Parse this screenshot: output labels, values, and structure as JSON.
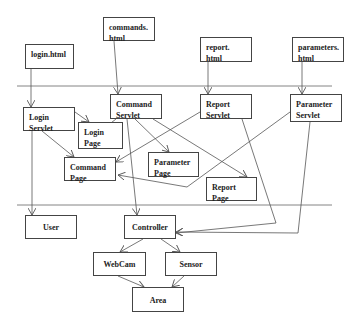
{
  "diagram": {
    "layers": [
      {
        "name": "client-layer-divider",
        "y": 86
      },
      {
        "name": "model-layer-divider",
        "y": 205
      }
    ],
    "nodes": [
      {
        "id": "login_html",
        "label": "login.html",
        "x": 25,
        "y": 44,
        "w": 49,
        "h": 25
      },
      {
        "id": "commands_html",
        "label": "commands.\nhtml",
        "x": 103,
        "y": 17,
        "w": 52,
        "h": 24
      },
      {
        "id": "report_html",
        "label": "report.\nhtml",
        "x": 200,
        "y": 37,
        "w": 52,
        "h": 25
      },
      {
        "id": "parameters_html",
        "label": "parameters.\nhtml",
        "x": 292,
        "y": 37,
        "w": 52,
        "h": 25
      },
      {
        "id": "login_servlet",
        "label": "Login\nServlet",
        "x": 23,
        "y": 107,
        "w": 52,
        "h": 24
      },
      {
        "id": "command_servlet",
        "label": "Command\nServlet",
        "x": 110,
        "y": 94,
        "w": 52,
        "h": 25
      },
      {
        "id": "login_page",
        "label": "Login\nPage",
        "x": 78,
        "y": 122,
        "w": 45,
        "h": 27
      },
      {
        "id": "report_servlet",
        "label": "Report\nServlet",
        "x": 200,
        "y": 94,
        "w": 52,
        "h": 25
      },
      {
        "id": "parameter_servlet",
        "label": "Parameter\nServlet",
        "x": 290,
        "y": 94,
        "w": 52,
        "h": 28
      },
      {
        "id": "command_page",
        "label": "Command\nPage",
        "x": 64,
        "y": 157,
        "w": 52,
        "h": 24
      },
      {
        "id": "parameter_page",
        "label": "Parameter\nPage",
        "x": 148,
        "y": 152,
        "w": 51,
        "h": 25
      },
      {
        "id": "report_page",
        "label": "Report\nPage",
        "x": 206,
        "y": 177,
        "w": 51,
        "h": 24
      },
      {
        "id": "user",
        "label": "User",
        "x": 25,
        "y": 215,
        "w": 52,
        "h": 24
      },
      {
        "id": "controller",
        "label": "Controller",
        "x": 124,
        "y": 215,
        "w": 52,
        "h": 24
      },
      {
        "id": "webcam",
        "label": "WebCam",
        "x": 93,
        "y": 252,
        "w": 53,
        "h": 24
      },
      {
        "id": "sensor",
        "label": "Sensor",
        "x": 165,
        "y": 252,
        "w": 52,
        "h": 24
      },
      {
        "id": "area",
        "label": "Area",
        "x": 132,
        "y": 287,
        "w": 52,
        "h": 25
      }
    ],
    "edges": [
      {
        "from": "login_html",
        "to": "login_servlet",
        "points": [
          [
            31,
            69
          ],
          [
            31,
            107
          ]
        ]
      },
      {
        "from": "commands_html",
        "to": "command_servlet",
        "points": [
          [
            114,
            41
          ],
          [
            118,
            94
          ]
        ]
      },
      {
        "from": "report_html",
        "to": "report_servlet",
        "points": [
          [
            208,
            62
          ],
          [
            208,
            94
          ]
        ]
      },
      {
        "from": "parameters_html",
        "to": "parameter_servlet",
        "points": [
          [
            302,
            62
          ],
          [
            302,
            94
          ]
        ]
      },
      {
        "from": "login_servlet",
        "to": "login_page",
        "points": [
          [
            75,
            112
          ],
          [
            89,
            122
          ]
        ]
      },
      {
        "from": "command_servlet",
        "to": "login_page",
        "points": [
          [
            116,
            119
          ],
          [
            102,
            130
          ]
        ]
      },
      {
        "from": "login_servlet",
        "to": "command_page",
        "points": [
          [
            42,
            131
          ],
          [
            74,
            157
          ]
        ]
      },
      {
        "from": "login_servlet",
        "to": "user",
        "points": [
          [
            32,
            131
          ],
          [
            32,
            215
          ]
        ]
      },
      {
        "from": "command_servlet",
        "to": "parameter_page",
        "points": [
          [
            135,
            119
          ],
          [
            169,
            152
          ]
        ]
      },
      {
        "from": "command_servlet",
        "to": "report_page",
        "points": [
          [
            153,
            119
          ],
          [
            247,
            177
          ]
        ]
      },
      {
        "from": "command_servlet",
        "to": "controller",
        "points": [
          [
            127,
            119
          ],
          [
            137,
            215
          ]
        ]
      },
      {
        "from": "report_servlet",
        "to": "command_page",
        "points": [
          [
            200,
            112
          ],
          [
            116,
            162
          ]
        ]
      },
      {
        "from": "parameter_servlet",
        "to": "command_page",
        "points": [
          [
            290,
            112
          ],
          [
            187,
            187
          ],
          [
            118,
            175
          ]
        ]
      },
      {
        "from": "report_servlet",
        "to": "controller",
        "points": [
          [
            242,
            119
          ],
          [
            276,
            223
          ],
          [
            176,
            233
          ]
        ]
      },
      {
        "from": "parameter_servlet",
        "to": "controller",
        "points": [
          [
            310,
            122
          ],
          [
            298,
            233
          ],
          [
            176,
            232
          ]
        ]
      },
      {
        "from": "controller",
        "to": "webcam",
        "points": [
          [
            143,
            239
          ],
          [
            120,
            252
          ]
        ]
      },
      {
        "from": "controller",
        "to": "sensor",
        "points": [
          [
            161,
            239
          ],
          [
            180,
            252
          ]
        ]
      },
      {
        "from": "webcam",
        "to": "area",
        "points": [
          [
            118,
            276
          ],
          [
            144,
            287
          ]
        ]
      },
      {
        "from": "sensor",
        "to": "area",
        "points": [
          [
            184,
            276
          ],
          [
            172,
            287
          ]
        ]
      }
    ],
    "colors": {
      "line": "#555555",
      "box_border": "#444444",
      "text": "#222222",
      "background": "#ffffff"
    }
  }
}
